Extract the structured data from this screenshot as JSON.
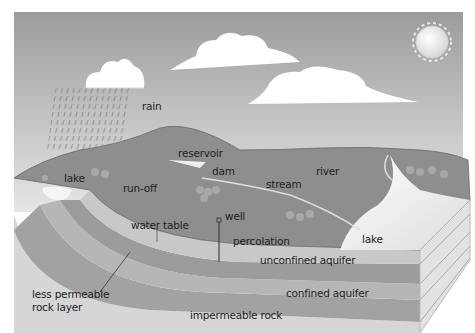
{
  "diagram": {
    "colors": {
      "sky_top": "#9a9a9a",
      "sky_bottom": "#e4e4e4",
      "land": "#8e8e8e",
      "unsaturated": "#c4c4c4",
      "unconfined_aquifer": "#9c9c9c",
      "less_permeable": "#b4b4b4",
      "confined_aquifer": "#a2a2a2",
      "impermeable": "#d6d6d6",
      "lake": "#f2f2f2",
      "cloud": "#ffffff",
      "sun": "#f0f0f0"
    },
    "labels": {
      "rain": "rain",
      "reservoir": "reservoir",
      "dam": "dam",
      "lake_left": "lake",
      "run_off": "run-off",
      "stream": "stream",
      "river": "river",
      "well": "well",
      "water_table": "water table",
      "percolation": "percolation",
      "lake_right": "lake",
      "unconfined_aquifer": "unconfined aquifer",
      "less_permeable_line1": "less permeable",
      "less_permeable_line2": "rock layer",
      "confined_aquifer": "confined aquifer",
      "impermeable_rock": "impermeable rock"
    }
  }
}
